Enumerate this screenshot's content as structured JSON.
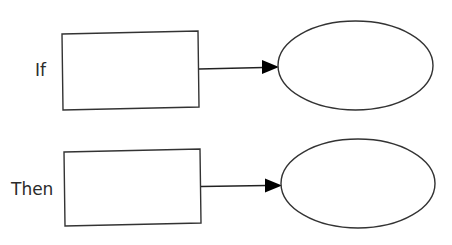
{
  "diagram": {
    "type": "if-then flow",
    "rows": [
      {
        "label": "If",
        "box_text": "",
        "ellipse_text": "",
        "connector": "arrow-right"
      },
      {
        "label": "Then",
        "box_text": "",
        "ellipse_text": "",
        "connector": "arrow-right"
      }
    ],
    "colors": {
      "background": "#ffffff",
      "stroke": "#333333",
      "arrowhead": "#000000",
      "text": "#2b2b2b"
    }
  }
}
